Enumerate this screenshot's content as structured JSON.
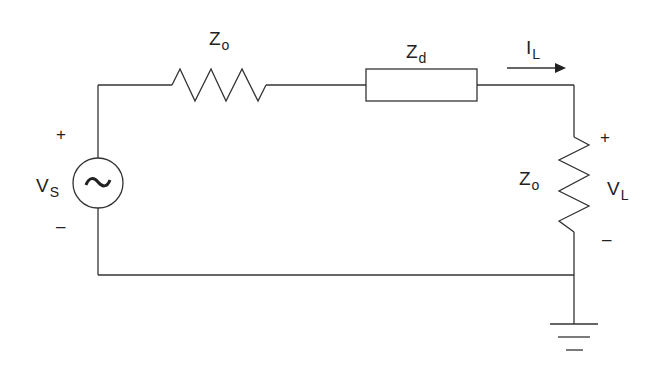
{
  "diagram": {
    "type": "circuit-schematic",
    "line_color": "#333333",
    "text_color": "#222222",
    "background": "#ffffff",
    "source": {
      "label_main": "V",
      "label_sub": "S",
      "symbol": "~",
      "plus": "+",
      "minus": "–"
    },
    "series_resistor": {
      "label_main": "Z",
      "label_sub": "o"
    },
    "device_impedance": {
      "label_main": "Z",
      "label_sub": "d"
    },
    "current": {
      "label_main": "I",
      "label_sub": "L"
    },
    "load_resistor": {
      "label_main": "Z",
      "label_sub": "o"
    },
    "load_voltage": {
      "label_main": "V",
      "label_sub": "L",
      "plus": "+",
      "minus": "–"
    },
    "ground": {
      "symbol": "ground-icon"
    }
  }
}
